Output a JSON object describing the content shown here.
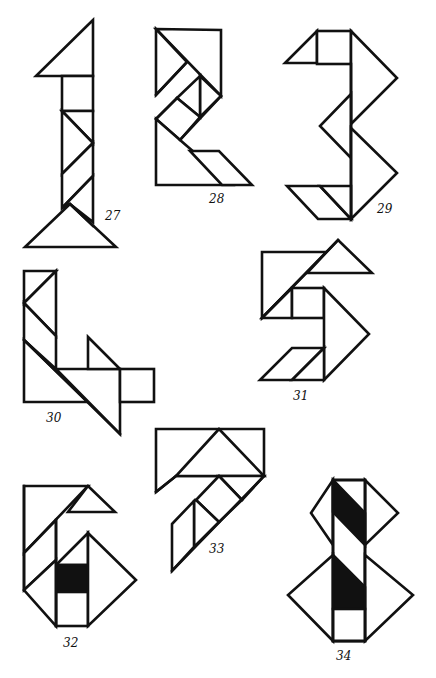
{
  "page": {
    "colors": {
      "ink": "#111111",
      "paper": "#ffffff"
    }
  },
  "figures": [
    {
      "id": "27",
      "label": "27",
      "depicts": "digit 1"
    },
    {
      "id": "28",
      "label": "28",
      "depicts": "digit 2"
    },
    {
      "id": "29",
      "label": "29",
      "depicts": "digit 3"
    },
    {
      "id": "30",
      "label": "30",
      "depicts": "digit 4"
    },
    {
      "id": "31",
      "label": "31",
      "depicts": "digit 5"
    },
    {
      "id": "32",
      "label": "32",
      "depicts": "digit 6"
    },
    {
      "id": "33",
      "label": "33",
      "depicts": "digit 7"
    },
    {
      "id": "34",
      "label": "34",
      "depicts": "digit 8"
    }
  ]
}
